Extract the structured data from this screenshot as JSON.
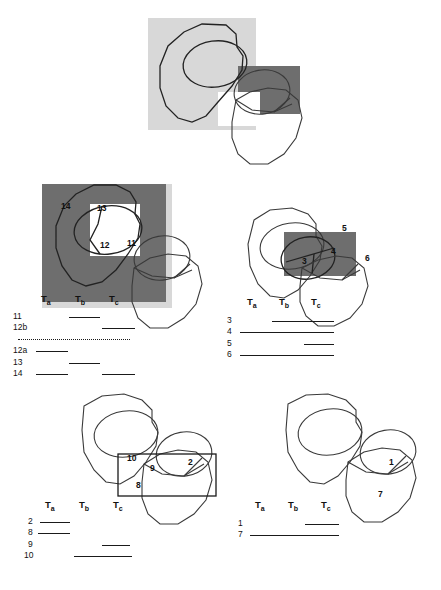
{
  "figure": {
    "background": "#ffffff",
    "colors": {
      "light_grey": "#d8d8d8",
      "dark_grey": "#6e6e6e",
      "outline": "#3a3a3a",
      "text": "#111111"
    }
  },
  "axis": {
    "ta": "T",
    "ta_sub": "a",
    "tb": "T",
    "tb_sub": "b",
    "tc": "T",
    "tc_sub": "c"
  },
  "panels": [
    {
      "id": "panel-top",
      "name": "top-panel",
      "highlights": [
        {
          "name": "light-grey-region",
          "shade": "light"
        },
        {
          "name": "dark-grey-region",
          "shade": "dark"
        }
      ],
      "callouts": [],
      "chart": null
    },
    {
      "id": "panel-middle-left",
      "name": "middle-left-panel",
      "highlights": [
        {
          "name": "light-grey-region",
          "shade": "light"
        },
        {
          "name": "dark-grey-region",
          "shade": "dark"
        },
        {
          "name": "white-inset-region",
          "shade": "white"
        }
      ],
      "callouts": [
        {
          "label": "14",
          "x": 45,
          "y": 22
        },
        {
          "label": "13",
          "x": 81,
          "y": 24
        },
        {
          "label": "12",
          "x": 85,
          "y": 60
        },
        {
          "label": "11",
          "x": 112,
          "y": 58
        }
      ],
      "chart": {
        "name": "chart-middle-left",
        "rows": [
          {
            "label": "11",
            "start": 1.06,
            "end": 1.95
          },
          {
            "label": "12b",
            "start": 2.02,
            "end": 2.98
          },
          {
            "label": "12a",
            "start": 0.03,
            "end": 0.96
          },
          {
            "label": "13",
            "start": 1.08,
            "end": 1.98
          },
          {
            "label": "14",
            "start": 0.02,
            "end": 0.98,
            "start2": 2.0,
            "end2": 2.98
          }
        ],
        "divider_after_row": 2,
        "divider_style": "dotted"
      }
    },
    {
      "id": "panel-middle-right",
      "name": "middle-right-panel",
      "highlights": [
        {
          "name": "dark-grey-region",
          "shade": "dark"
        }
      ],
      "callouts": [
        {
          "label": "5",
          "x": 84,
          "y": 28
        },
        {
          "label": "6",
          "x": 114,
          "y": 56
        },
        {
          "label": "4",
          "x": 79,
          "y": 50
        },
        {
          "label": "3",
          "x": 53,
          "y": 60
        }
      ],
      "chart": {
        "name": "chart-middle-right",
        "rows": [
          {
            "label": "3",
            "start": 1.0,
            "end": 2.98
          },
          {
            "label": "4",
            "start": 0.0,
            "end": 2.98
          },
          {
            "label": "5",
            "start": 2.0,
            "end": 2.98
          },
          {
            "label": "6",
            "start": 0.0,
            "end": 2.98
          }
        ],
        "divider_after_row": null
      }
    },
    {
      "id": "panel-bottom-left",
      "name": "bottom-left-panel",
      "highlights": [
        {
          "name": "outlined-box-region",
          "shade": "none"
        }
      ],
      "callouts": [
        {
          "label": "10",
          "x": 118,
          "y": 69
        },
        {
          "label": "9",
          "x": 140,
          "y": 80
        },
        {
          "label": "2",
          "x": 170,
          "y": 73
        },
        {
          "label": "8",
          "x": 128,
          "y": 94
        }
      ],
      "chart": {
        "name": "chart-bottom-left",
        "rows": [
          {
            "label": "2",
            "start": 0.02,
            "end": 0.9
          },
          {
            "label": "8",
            "start": 0.0,
            "end": 0.92
          },
          {
            "label": "9",
            "start": 1.95,
            "end": 2.8
          },
          {
            "label": "10",
            "start": 1.05,
            "end": 2.98
          }
        ],
        "divider_after_row": null
      }
    },
    {
      "id": "panel-bottom-right",
      "name": "bottom-right-panel",
      "highlights": [],
      "callouts": [
        {
          "label": "1",
          "x": 142,
          "y": 73
        },
        {
          "label": "7",
          "x": 130,
          "y": 105
        }
      ],
      "chart": {
        "name": "chart-bottom-right",
        "rows": [
          {
            "label": "1",
            "start": 1.7,
            "end": 2.8
          },
          {
            "label": "7",
            "start": 0.0,
            "end": 2.8
          }
        ],
        "divider_after_row": null
      }
    }
  ]
}
